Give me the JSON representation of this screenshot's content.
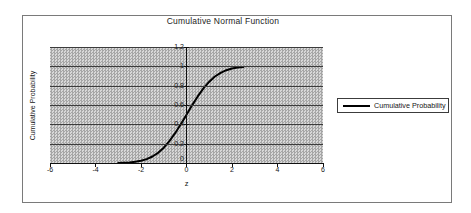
{
  "chart": {
    "title": "Cumulative Normal Function",
    "legend": {
      "label": "Cumulative Probability"
    },
    "colors": {
      "series": "#000000",
      "plot_bg_dark": "#a6a6a6",
      "plot_bg_light": "#d8d8d8",
      "gridline": "#3c3c3c",
      "axis": "#101010",
      "frame_border": "#7a7a7a",
      "legend_border": "#3c3c3c",
      "legend_bg": "#ffffff"
    }
  },
  "chart_data": {
    "type": "line",
    "title": "Cumulative Normal Function",
    "xlabel": "z",
    "ylabel": "Cumulative Probability",
    "xlim": [
      -6,
      6
    ],
    "ylim": [
      0,
      1.2
    ],
    "x_ticks": [
      -6,
      -4,
      -2,
      0,
      2,
      4,
      6
    ],
    "x_tick_labels": [
      "-6",
      "-4",
      "-2",
      "0",
      "2",
      "4",
      "6"
    ],
    "y_ticks": [
      0,
      0.2,
      0.4,
      0.6,
      0.8,
      1,
      1.2
    ],
    "y_tick_labels_top_to_bottom": [
      "1.2",
      "1",
      "0.8",
      "0.6",
      "0.4",
      "0.2",
      "0"
    ],
    "grid": "horizontal",
    "legend_position": "right",
    "series": [
      {
        "name": "Cumulative Probability",
        "x": [
          -3,
          -2.75,
          -2.5,
          -2.25,
          -2,
          -1.75,
          -1.5,
          -1.25,
          -1,
          -0.75,
          -0.5,
          -0.25,
          0,
          0.25,
          0.5,
          0.75,
          1,
          1.25,
          1.5,
          1.75,
          2,
          2.25,
          2.5
        ],
        "y": [
          0.0013,
          0.003,
          0.0062,
          0.0122,
          0.0228,
          0.0401,
          0.0668,
          0.1056,
          0.1587,
          0.2266,
          0.3085,
          0.4013,
          0.5,
          0.5987,
          0.6915,
          0.7734,
          0.8413,
          0.8944,
          0.9332,
          0.9599,
          0.9772,
          0.9878,
          0.9938
        ]
      }
    ]
  }
}
